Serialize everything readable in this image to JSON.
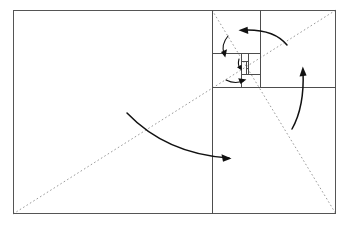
{
  "figure": {
    "title": "Golden rectangle whirling-squares subdivision with rotation arrows",
    "type": "geometric-diagram",
    "canvas": {
      "width": 348,
      "height": 231
    },
    "colors": {
      "background": "#ffffff",
      "frame_stroke": "#555555",
      "solid_stroke": "#4d4d4d",
      "dashed_stroke": "#9a9a9a",
      "arrow_stroke": "#111111"
    },
    "outer_rectangle": {
      "label": "golden rectangle",
      "x": 13,
      "y": 10,
      "width": 323,
      "height": 204
    },
    "subdivision_lines": [
      {
        "name": "square-1-right-edge",
        "orientation": "vertical",
        "x1": 212,
        "y1": 10,
        "x2": 212,
        "y2": 214
      },
      {
        "name": "square-2-bottom-edge",
        "orientation": "horizontal",
        "x1": 212,
        "y1": 87,
        "x2": 336,
        "y2": 87
      },
      {
        "name": "square-3-left-edge",
        "orientation": "vertical",
        "x1": 260,
        "y1": 10,
        "x2": 260,
        "y2": 87
      },
      {
        "name": "square-4-top-edge",
        "orientation": "horizontal",
        "x1": 212,
        "y1": 53,
        "x2": 260,
        "y2": 53
      },
      {
        "name": "square-5-right-edge",
        "orientation": "vertical",
        "x1": 241,
        "y1": 53,
        "x2": 241,
        "y2": 87
      },
      {
        "name": "square-6-bottom-edge",
        "orientation": "horizontal",
        "x1": 241,
        "y1": 74,
        "x2": 260,
        "y2": 74
      },
      {
        "name": "square-7-left-edge",
        "orientation": "vertical",
        "x1": 248,
        "y1": 53,
        "x2": 248,
        "y2": 74
      },
      {
        "name": "square-8-top-edge",
        "orientation": "horizontal",
        "x1": 241,
        "y1": 61,
        "x2": 248,
        "y2": 61
      },
      {
        "name": "square-9-right-edge",
        "orientation": "vertical",
        "x1": 246,
        "y1": 61,
        "x2": 246,
        "y2": 74
      },
      {
        "name": "square-10-bottom-edge",
        "orientation": "horizontal",
        "x1": 246,
        "y1": 68,
        "x2": 248,
        "y2": 68
      }
    ],
    "diagonals": [
      {
        "name": "main-diagonal",
        "style": "dashed",
        "x1": 13,
        "y1": 214,
        "x2": 336,
        "y2": 10
      },
      {
        "name": "reciprocal-diagonal",
        "style": "dashed",
        "x1": 212,
        "y1": 10,
        "x2": 336,
        "y2": 214
      }
    ],
    "arrows": [
      {
        "name": "outer-rotation-arrow",
        "direction": "clockwise",
        "size": "large"
      },
      {
        "name": "right-rotation-arrow",
        "direction": "clockwise",
        "size": "medium"
      },
      {
        "name": "top-rotation-arrow",
        "direction": "clockwise",
        "size": "medium"
      },
      {
        "name": "inner-left-rotation-arrow",
        "direction": "clockwise",
        "size": "small"
      },
      {
        "name": "inner-bottom-rotation-arrow",
        "direction": "clockwise",
        "size": "small"
      },
      {
        "name": "center-rotation-arrow",
        "direction": "clockwise",
        "size": "tiny"
      }
    ]
  }
}
